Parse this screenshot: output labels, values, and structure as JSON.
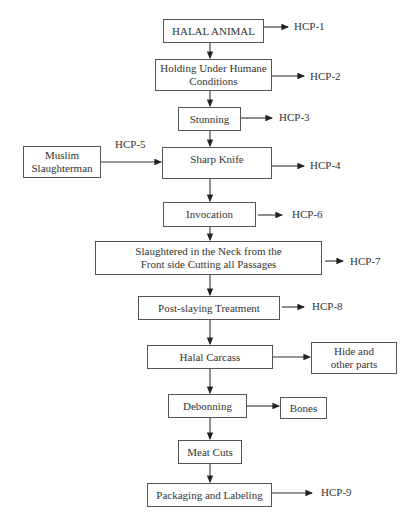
{
  "diagram": {
    "type": "flowchart",
    "nodes": {
      "halal_animal": "HALAL ANIMAL",
      "holding": "Holding Under Humane Conditions",
      "stunning": "Stunning",
      "muslim": "Muslim Slaughterman",
      "sharp_knife": "Sharp Knife",
      "invocation": "Invocation",
      "slaughtered": "Slaughtered in the Neck from the Front side Cutting all Passages",
      "post_slaying": "Post-slaying Treatment",
      "halal_carcass": "Halal Carcass",
      "hide": "Hide and other parts",
      "debonning": "Debonning",
      "bones": "Bones",
      "meat_cuts": "Meat Cuts",
      "packaging": "Packaging and Labeling"
    },
    "hcp": {
      "hcp1": "HCP-1",
      "hcp2": "HCP-2",
      "hcp3": "HCP-3",
      "hcp4": "HCP-4",
      "hcp5": "HCP-5",
      "hcp6": "HCP-6",
      "hcp7": "HCP-7",
      "hcp8": "HCP-8",
      "hcp9": "HCP-9"
    },
    "edges": [
      [
        "HALAL ANIMAL",
        "Holding Under Humane Conditions"
      ],
      [
        "Holding Under Humane Conditions",
        "Stunning"
      ],
      [
        "Stunning",
        "Sharp Knife"
      ],
      [
        "Muslim Slaughterman",
        "Sharp Knife"
      ],
      [
        "Sharp Knife",
        "Invocation"
      ],
      [
        "Invocation",
        "Slaughtered in the Neck from the Front side Cutting all Passages"
      ],
      [
        "Slaughtered in the Neck from the Front side Cutting all Passages",
        "Post-slaying Treatment"
      ],
      [
        "Post-slaying Treatment",
        "Halal Carcass"
      ],
      [
        "Halal Carcass",
        "Hide and other parts"
      ],
      [
        "Halal Carcass",
        "Debonning"
      ],
      [
        "Debonning",
        "Bones"
      ],
      [
        "Debonning",
        "Meat Cuts"
      ],
      [
        "Meat Cuts",
        "Packaging and Labeling"
      ]
    ]
  }
}
